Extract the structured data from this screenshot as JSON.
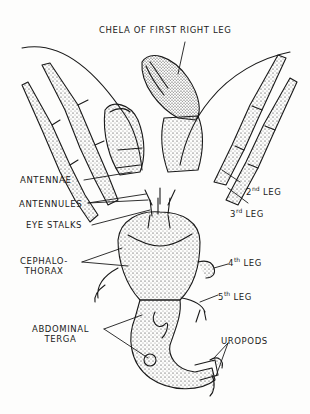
{
  "diagram": {
    "ink_color": "#1a1a1a",
    "paper_color": "#fdfdfc",
    "labels": {
      "chela": "CHELA OF FIRST RIGHT LEG",
      "antennae": "ANTENNAE",
      "antennules": "ANTENNULES",
      "eye_stalks": "EYE STALKS",
      "cephalothorax_1": "CEPHALO-",
      "cephalothorax_2": "THORAX",
      "abdominal_1": "ABDOMINAL",
      "abdominal_2": "TERGA",
      "uropods": "UROPODS",
      "leg2_num": "2",
      "leg2_sup": "nd",
      "leg3_num": "3",
      "leg3_sup": "rd",
      "leg4_num": "4",
      "leg4_sup": "th",
      "leg5_num": "5",
      "leg5_sup": "th",
      "leg_word": "LEG"
    }
  }
}
